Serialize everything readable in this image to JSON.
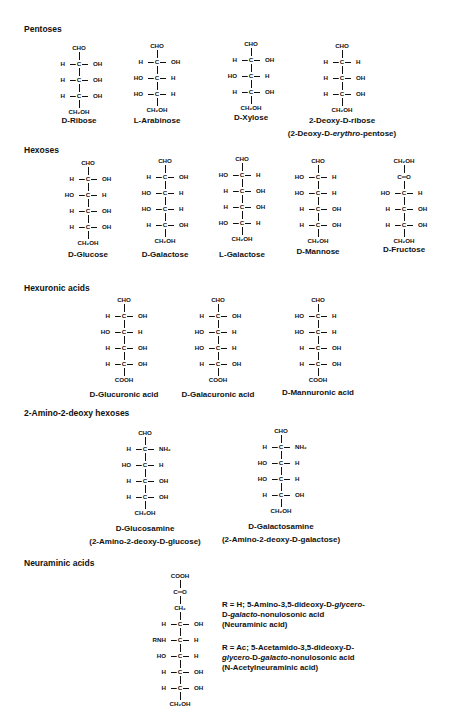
{
  "sections": {
    "pentoses": "Pentoses",
    "hexoses": "Hexoses",
    "hexuronic": "Hexuronic acids",
    "aminohexoses": "2-Amino-2-deoxy hexoses",
    "neuraminic": "Neuraminic acids"
  },
  "structures": {
    "ribose": {
      "top": "CHO",
      "rows": [
        [
          "H",
          "OH"
        ],
        [
          "H",
          "OH"
        ],
        [
          "H",
          "OH"
        ]
      ],
      "bottom": "CH₂OH",
      "name": "D-Ribose"
    },
    "arabinose": {
      "top": "CHO",
      "rows": [
        [
          "H",
          "OH"
        ],
        [
          "HO",
          "H"
        ],
        [
          "HO",
          "H"
        ]
      ],
      "bottom": "CH₂OH",
      "name": "L-Arabinose"
    },
    "xylose": {
      "top": "CHO",
      "rows": [
        [
          "H",
          "OH"
        ],
        [
          "HO",
          "H"
        ],
        [
          "H",
          "OH"
        ]
      ],
      "bottom": "CH₂OH",
      "name": "D-Xylose"
    },
    "deoxyribose": {
      "top": "CHO",
      "rows": [
        [
          "H",
          "H"
        ],
        [
          "H",
          "OH"
        ],
        [
          "H",
          "OH"
        ]
      ],
      "bottom": "CH₂OH",
      "name": "2-Deoxy-D-ribose",
      "subname_pre": "(2-Deoxy-D-",
      "subname_ital": "erythro",
      "subname_post": "-pentose)"
    },
    "glucose": {
      "top": "CHO",
      "rows": [
        [
          "H",
          "OH"
        ],
        [
          "HO",
          "H"
        ],
        [
          "H",
          "OH"
        ],
        [
          "H",
          "OH"
        ]
      ],
      "bottom": "CH₂OH",
      "name": "D-Glucose"
    },
    "galactose": {
      "top": "CHO",
      "rows": [
        [
          "H",
          "OH"
        ],
        [
          "HO",
          "H"
        ],
        [
          "HO",
          "H"
        ],
        [
          "H",
          "OH"
        ]
      ],
      "bottom": "CH₂OH",
      "name": "D-Galactose"
    },
    "lgalactose": {
      "top": "CHO",
      "rows": [
        [
          "HO",
          "H"
        ],
        [
          "H",
          "OH"
        ],
        [
          "H",
          "OH"
        ],
        [
          "HO",
          "H"
        ]
      ],
      "bottom": "CH₂OH",
      "name": "L-Galactose"
    },
    "mannose": {
      "top": "CHO",
      "rows": [
        [
          "HO",
          "H"
        ],
        [
          "HO",
          "H"
        ],
        [
          "H",
          "OH"
        ],
        [
          "H",
          "OH"
        ]
      ],
      "bottom": "CH₂OH",
      "name": "D-Mannose"
    },
    "fructose": {
      "top": "CH₂OH",
      "keto": "C═O",
      "rows": [
        [
          "HO",
          "H"
        ],
        [
          "H",
          "OH"
        ],
        [
          "H",
          "OH"
        ]
      ],
      "bottom": "CH₂OH",
      "name": "D-Fructose"
    },
    "glucuronic": {
      "top": "CHO",
      "rows": [
        [
          "H",
          "OH"
        ],
        [
          "HO",
          "H"
        ],
        [
          "H",
          "OH"
        ],
        [
          "H",
          "OH"
        ]
      ],
      "bottom": "COOH",
      "name": "D-Glucuronic acid"
    },
    "galacuronic": {
      "top": "CHO",
      "rows": [
        [
          "H",
          "OH"
        ],
        [
          "HO",
          "H"
        ],
        [
          "HO",
          "H"
        ],
        [
          "H",
          "OH"
        ]
      ],
      "bottom": "COOH",
      "name": "D-Galacuronic acid"
    },
    "mannuronic": {
      "top": "CHO",
      "rows": [
        [
          "HO",
          "H"
        ],
        [
          "HO",
          "H"
        ],
        [
          "H",
          "OH"
        ],
        [
          "H",
          "OH"
        ]
      ],
      "bottom": "COOH",
      "name": "D-Mannuronic acid"
    },
    "glucosamine": {
      "top": "CHO",
      "rows": [
        [
          "H",
          "NH₂"
        ],
        [
          "HO",
          "H"
        ],
        [
          "H",
          "OH"
        ],
        [
          "H",
          "OH"
        ]
      ],
      "bottom": "CH₂OH",
      "name": "D-Glucosamine",
      "subname": "(2-Amino-2-deoxy-D-glucose)"
    },
    "galactosamine": {
      "top": "CHO",
      "rows": [
        [
          "H",
          "NH₂"
        ],
        [
          "HO",
          "H"
        ],
        [
          "HO",
          "H"
        ],
        [
          "H",
          "OH"
        ]
      ],
      "bottom": "CH₂OH",
      "name": "D-Galactosamine",
      "subname": "(2-Amino-2-deoxy-D-galactose)"
    },
    "neuraminic": {
      "top": "COOH",
      "keto": "C═O",
      "ch2": "CH₂",
      "rows": [
        [
          "H",
          "OH"
        ],
        [
          "RNH",
          "H"
        ],
        [
          "HO",
          "H"
        ],
        [
          "H",
          "OH"
        ],
        [
          "H",
          "OH"
        ]
      ],
      "bottom": "CH₂OH"
    }
  },
  "neuraminic_desc": {
    "r_h": {
      "l1a": "R = H; 5-Amino-3,5-dideoxy-D-",
      "l1b": "glycero",
      "l1c": "-",
      "l2a": "D-",
      "l2b": "galacto",
      "l2c": "-nonulosonic acid",
      "l3": "(Neuraminic acid)"
    },
    "r_ac": {
      "l1": "R = Ac; 5-Acetamido-3,5-dideoxy-D-",
      "l2a": "glycero",
      "l2b": "-D-",
      "l2c": "galacto",
      "l2d": "-nonulosonic acid",
      "l3": "(N-Acetylneuraminic acid)"
    }
  }
}
